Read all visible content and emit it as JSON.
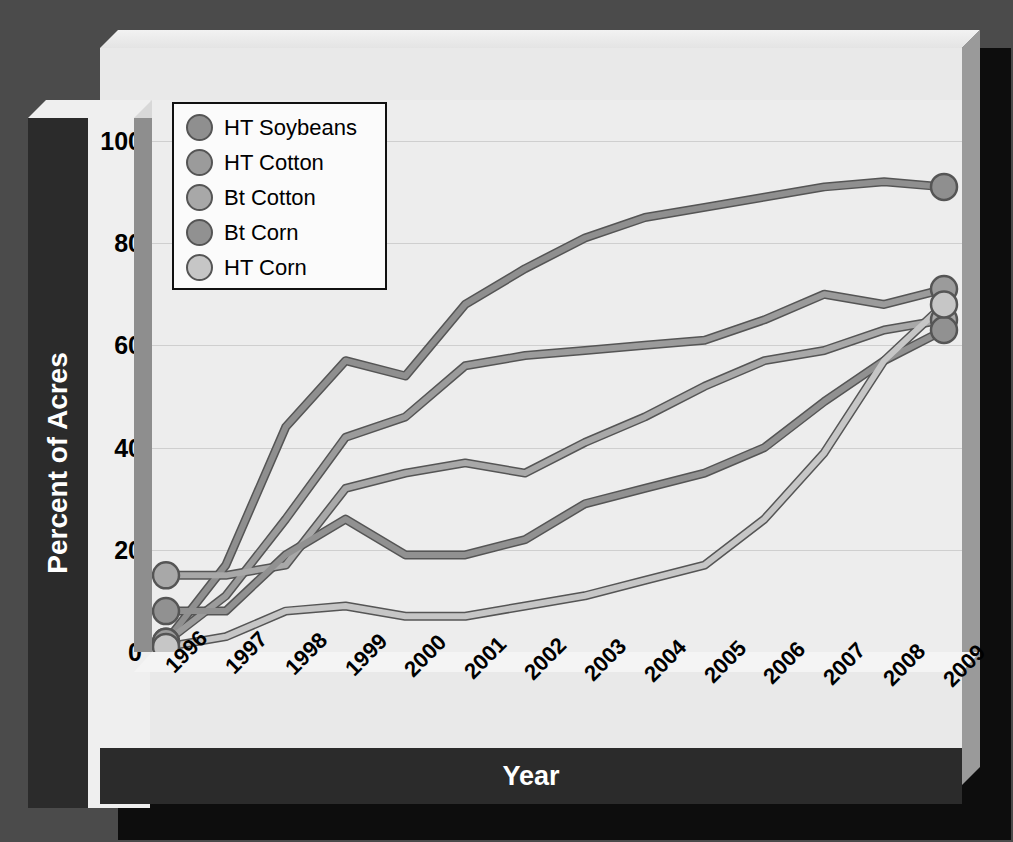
{
  "axis": {
    "y_title": "Percent of Acres",
    "x_title": "Year",
    "y_ticks": [
      0,
      20,
      40,
      60,
      80,
      100
    ],
    "x_ticks": [
      "1996",
      "1997",
      "1998",
      "1999",
      "2000",
      "2001",
      "2002",
      "2003",
      "2004",
      "2005",
      "2006",
      "2007",
      "2008",
      "2009"
    ]
  },
  "legend": {
    "items": [
      {
        "label": "HT Soybeans",
        "color": "#8f8f8f"
      },
      {
        "label": "HT Cotton",
        "color": "#9b9b9b"
      },
      {
        "label": "Bt Cotton",
        "color": "#a8a8a8"
      },
      {
        "label": "Bt Corn",
        "color": "#919191"
      },
      {
        "label": "HT Corn",
        "color": "#c6c6c6"
      }
    ]
  },
  "colors": {
    "page_background": "#4b4b4b",
    "plot_background": "#ededed",
    "slab": "#e9e9e9",
    "dark_band": "#2b2b2b",
    "shadow": "#0d0d0d",
    "gridline": "#cfcfcf",
    "line_stroke": "#555555"
  },
  "chart_data": {
    "type": "line",
    "title": "",
    "xlabel": "Year",
    "ylabel": "Percent of Acres",
    "x": [
      1996,
      1997,
      1998,
      1999,
      2000,
      2001,
      2002,
      2003,
      2004,
      2005,
      2006,
      2007,
      2008,
      2009
    ],
    "xlim": [
      1996,
      2009
    ],
    "ylim": [
      0,
      108
    ],
    "grid": true,
    "legend_position": "top-left",
    "series": [
      {
        "name": "HT Soybeans",
        "color": "#8f8f8f",
        "values": [
          2,
          17,
          44,
          57,
          54,
          68,
          75,
          81,
          85,
          87,
          89,
          91,
          92,
          91
        ]
      },
      {
        "name": "HT Cotton",
        "color": "#9b9b9b",
        "values": [
          2,
          11,
          26,
          42,
          46,
          56,
          58,
          59,
          60,
          61,
          65,
          70,
          68,
          71
        ]
      },
      {
        "name": "Bt Cotton",
        "color": "#a8a8a8",
        "values": [
          15,
          15,
          17,
          32,
          35,
          37,
          35,
          41,
          46,
          52,
          57,
          59,
          63,
          65
        ]
      },
      {
        "name": "Bt Corn",
        "color": "#919191",
        "values": [
          8,
          8,
          19,
          26,
          19,
          19,
          22,
          29,
          32,
          35,
          40,
          49,
          57,
          63
        ]
      },
      {
        "name": "HT Corn",
        "color": "#c6c6c6",
        "values": [
          1,
          3,
          8,
          9,
          7,
          7,
          9,
          11,
          14,
          17,
          26,
          39,
          57,
          68
        ]
      }
    ]
  }
}
